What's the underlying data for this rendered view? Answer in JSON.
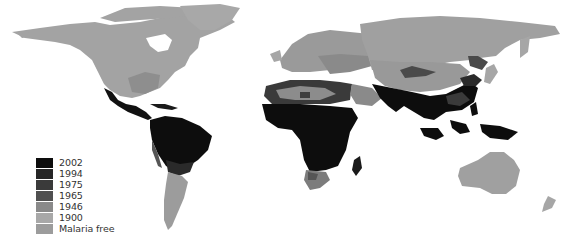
{
  "map": {
    "subject": "Historical and current global distribution of malaria",
    "colors": {
      "2002": "#0d0d0d",
      "1994": "#262626",
      "1975": "#3a3a3a",
      "1965": "#505050",
      "1946": "#7d7d7d",
      "1900": "#a2a2a2",
      "malaria_free": "#999999",
      "background": "#ffffff"
    }
  },
  "legend": {
    "items": [
      {
        "label": "2002",
        "color": "#0d0d0d"
      },
      {
        "label": "1994",
        "color": "#262626"
      },
      {
        "label": "1975",
        "color": "#3a3a3a"
      },
      {
        "label": "1965",
        "color": "#505050"
      },
      {
        "label": "1946",
        "color": "#8a8a8a"
      },
      {
        "label": "1900",
        "color": "#a8a8a8"
      },
      {
        "label": "Malaria free",
        "color": "#9c9c9c"
      }
    ]
  }
}
